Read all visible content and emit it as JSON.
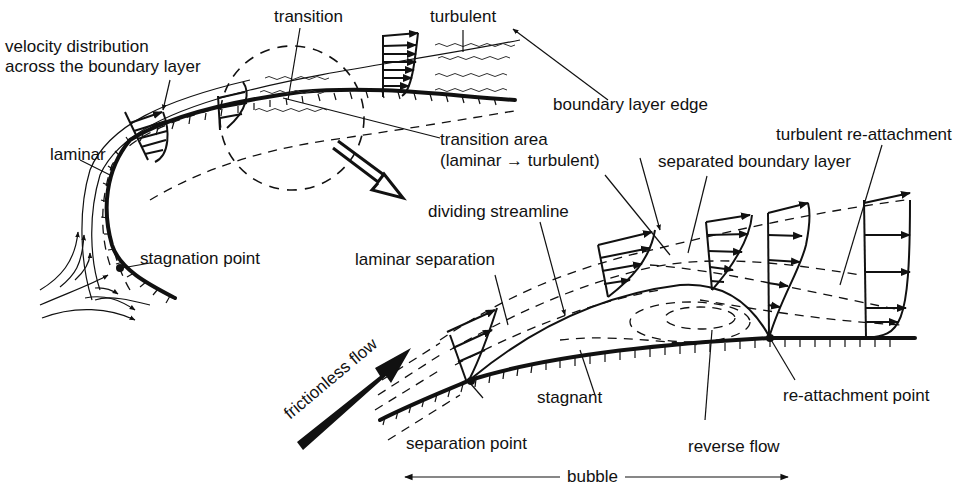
{
  "diagram": {
    "labels": {
      "velocity_distribution_line1": "velocity distribution",
      "velocity_distribution_line2": "across the boundary layer",
      "transition": "transition",
      "turbulent": "turbulent",
      "laminar": "laminar",
      "boundary_layer_edge": "boundary layer edge",
      "transition_area_line1": "transition area",
      "transition_area_line2": "(laminar → turbulent)",
      "turbulent_reattachment": "turbulent re-attachment",
      "separated_boundary_layer": "separated boundary layer",
      "dividing_streamline": "dividing streamline",
      "stagnation_point": "stagnation point",
      "laminar_separation": "laminar separation",
      "frictionless_flow": "frictionless flow",
      "stagnant": "stagnant",
      "reattachment_point": "re-attachment point",
      "separation_point": "separation point",
      "reverse_flow": "reverse flow",
      "bubble": "bubble"
    },
    "colors": {
      "ink": "#111111",
      "background": "#ffffff"
    }
  }
}
